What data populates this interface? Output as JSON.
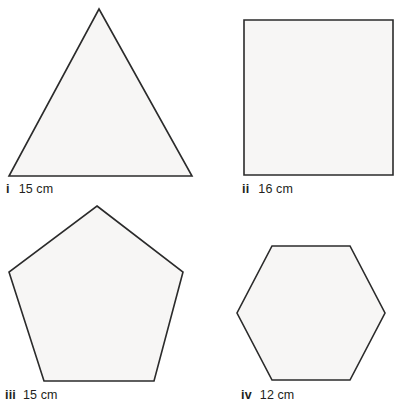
{
  "figure": {
    "background_color": "#ffffff",
    "shape_fill_color": "#f7f6f5",
    "shape_stroke_color": "#2b2b2b",
    "text_color": "#231f20",
    "width": 399,
    "height": 409
  },
  "shapes": [
    {
      "numeral": "i",
      "measure": "15 cm",
      "name": "equilateral-triangle",
      "sides": 3,
      "side_length_value": 15,
      "side_length_unit": "cm",
      "points": "99,9 192,176 9,176"
    },
    {
      "numeral": "ii",
      "measure": "16 cm",
      "name": "square",
      "sides": 4,
      "side_length_value": 16,
      "side_length_unit": "cm",
      "points": "244,20 393,20 393,175 244,175"
    },
    {
      "numeral": "iii",
      "measure": "15 cm",
      "name": "regular-pentagon",
      "sides": 5,
      "side_length_value": 15,
      "side_length_unit": "cm",
      "points": "97,206 183,272 154,381 44,381 9,272"
    },
    {
      "numeral": "iv",
      "measure": "12 cm",
      "name": "regular-hexagon",
      "sides": 6,
      "side_length_value": 12,
      "side_length_unit": "cm",
      "points": "272,246 350,246 385,313 350,380 272,380 237,313"
    }
  ]
}
